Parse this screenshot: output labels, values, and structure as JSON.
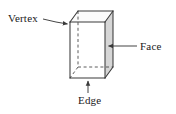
{
  "figure": {
    "background_color": "#ffffff",
    "stroke_color": "#3a3a3a",
    "labels": {
      "vertex": "Vertex",
      "face": "Face",
      "edge": "Edge"
    },
    "icons": {
      "vertex_pointer": "arrow-down-right-icon",
      "face_pointer": "arrow-left-icon",
      "edge_pointer": "arrow-up-icon"
    },
    "shape": {
      "name": "cube",
      "projection": "oblique",
      "front_face_fill": "#ffffff",
      "right_face_fill": "#d7d7d7",
      "top_face_fill": "#fbfbfb",
      "hidden_edge_style": "dashed",
      "front_face": [
        [
          70,
          22
        ],
        [
          105,
          22
        ],
        [
          105,
          78
        ],
        [
          70,
          78
        ]
      ],
      "back_offset": [
        8,
        -11
      ],
      "visible_vertices": [
        [
          70,
          22
        ],
        [
          105,
          22
        ],
        [
          105,
          78
        ],
        [
          70,
          78
        ],
        [
          78,
          11
        ],
        [
          113,
          11
        ],
        [
          113,
          67
        ]
      ],
      "hidden_vertex": [
        78,
        67
      ]
    },
    "annotations": [
      {
        "label": "Vertex",
        "points_to": [
          70,
          22
        ],
        "leader_from": [
          44,
          20
        ]
      },
      {
        "label": "Face",
        "points_to": [
          107,
          46
        ],
        "leader_from": [
          137,
          46
        ]
      },
      {
        "label": "Edge",
        "points_to": [
          88,
          80
        ],
        "leader_from": [
          88,
          93
        ]
      }
    ]
  }
}
